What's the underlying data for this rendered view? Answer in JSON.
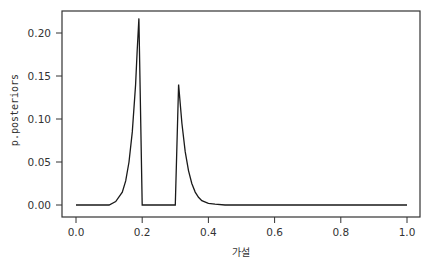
{
  "chart_data": {
    "type": "line",
    "title": "",
    "xlabel": "가설",
    "ylabel": "p.posteriors",
    "xlim": [
      0.0,
      1.0
    ],
    "ylim": [
      0.0,
      0.22
    ],
    "grid": false,
    "legend": null,
    "x_ticks": [
      "0.0",
      "0.2",
      "0.4",
      "0.6",
      "0.8",
      "1.0"
    ],
    "y_ticks": [
      "0.00",
      "0.05",
      "0.10",
      "0.15",
      "0.20"
    ],
    "series": [
      {
        "name": "p.posteriors",
        "color": "#1a1a1a",
        "x": [
          0.0,
          0.05,
          0.1,
          0.12,
          0.14,
          0.15,
          0.16,
          0.17,
          0.18,
          0.185,
          0.19,
          0.2,
          0.25,
          0.3,
          0.31,
          0.32,
          0.33,
          0.34,
          0.35,
          0.36,
          0.37,
          0.38,
          0.4,
          0.42,
          0.45,
          0.5,
          0.6,
          0.8,
          1.0
        ],
        "y": [
          0.0,
          0.0,
          0.0,
          0.004,
          0.015,
          0.028,
          0.05,
          0.085,
          0.14,
          0.18,
          0.217,
          0.0,
          0.0,
          0.0,
          0.14,
          0.095,
          0.062,
          0.04,
          0.025,
          0.015,
          0.009,
          0.005,
          0.002,
          0.001,
          0.0,
          0.0,
          0.0,
          0.0,
          0.0
        ]
      }
    ]
  },
  "labels": {
    "xlabel": "가설",
    "ylabel": "p.posteriors",
    "x_ticks": [
      "0.0",
      "0.2",
      "0.4",
      "0.6",
      "0.8",
      "1.0"
    ],
    "y_ticks": [
      "0.00",
      "0.05",
      "0.10",
      "0.15",
      "0.20"
    ]
  }
}
